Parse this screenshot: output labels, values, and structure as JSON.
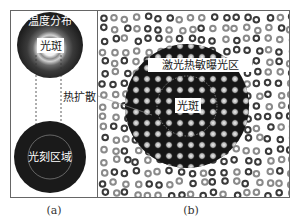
{
  "figure": {
    "panel_a": {
      "label": "(a)",
      "top_circle_label": "温度分布",
      "spot_label": "光斑",
      "bottom_circle_label": "光刻区域",
      "arrow_label": "热扩散"
    },
    "panel_b": {
      "label": "(b)",
      "region_label": "激光热敏曝光区",
      "spot_label": "光斑"
    }
  },
  "colors": {
    "frame": "#555555",
    "dark_region": "#1a1a1a",
    "atom_dark": "#3a3a3a",
    "atom_light": "#8a8a8a",
    "bright_atom": "#d8d8d8",
    "label_bg": "#ffffff"
  }
}
